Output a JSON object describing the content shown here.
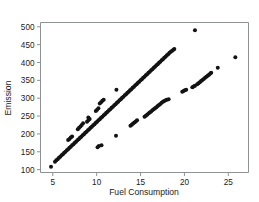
{
  "chart_data": {
    "type": "scatter",
    "title": "",
    "xlabel": "Fuel Consumption",
    "ylabel": "Emission",
    "xlim": [
      3.6,
      27.3
    ],
    "ylim": [
      92,
      512
    ],
    "xticks": [
      5,
      10,
      15,
      20,
      25
    ],
    "xtick_labels": [
      "5",
      "10",
      "15",
      "20",
      "25"
    ],
    "yticks": [
      100,
      150,
      200,
      250,
      300,
      350,
      400,
      450,
      500
    ],
    "ytick_labels": [
      "100",
      "150",
      "200",
      "250",
      "300",
      "350",
      "400",
      "450",
      "500"
    ],
    "grid": false,
    "legend": "none",
    "marker": "filled-circle",
    "marker_color": "#131313",
    "frame_color": "#8e9196",
    "background": "#ffffff",
    "series": [
      {
        "name": "main-band",
        "comment": "dense upper linear band, slope approx 23.5 emission per unit fuel",
        "points": [
          [
            5.25,
            122
          ],
          [
            5.4,
            126
          ],
          [
            5.55,
            129
          ],
          [
            5.7,
            133
          ],
          [
            5.85,
            136
          ],
          [
            6.0,
            140
          ],
          [
            6.15,
            143
          ],
          [
            6.3,
            147
          ],
          [
            6.45,
            150
          ],
          [
            6.6,
            154
          ],
          [
            6.75,
            157
          ],
          [
            6.9,
            161
          ],
          [
            7.05,
            164
          ],
          [
            7.2,
            168
          ],
          [
            7.35,
            171
          ],
          [
            7.5,
            175
          ],
          [
            7.65,
            178
          ],
          [
            7.8,
            182
          ],
          [
            7.95,
            185
          ],
          [
            8.1,
            189
          ],
          [
            8.25,
            192
          ],
          [
            8.4,
            196
          ],
          [
            8.55,
            199
          ],
          [
            8.7,
            203
          ],
          [
            8.85,
            206
          ],
          [
            9.0,
            210
          ],
          [
            9.15,
            213
          ],
          [
            9.3,
            217
          ],
          [
            9.45,
            220
          ],
          [
            9.6,
            224
          ],
          [
            9.75,
            227
          ],
          [
            9.9,
            231
          ],
          [
            10.05,
            234
          ],
          [
            10.2,
            238
          ],
          [
            10.35,
            241
          ],
          [
            10.5,
            245
          ],
          [
            10.65,
            248
          ],
          [
            10.8,
            252
          ],
          [
            10.95,
            255
          ],
          [
            11.1,
            259
          ],
          [
            11.25,
            262
          ],
          [
            11.4,
            266
          ],
          [
            11.55,
            269
          ],
          [
            11.7,
            273
          ],
          [
            11.85,
            276
          ],
          [
            12.0,
            280
          ],
          [
            12.15,
            283
          ],
          [
            12.3,
            287
          ],
          [
            12.45,
            290
          ],
          [
            12.6,
            294
          ],
          [
            12.75,
            297
          ],
          [
            12.9,
            301
          ],
          [
            13.05,
            304
          ],
          [
            13.2,
            308
          ],
          [
            13.35,
            311
          ],
          [
            13.5,
            315
          ],
          [
            13.65,
            318
          ],
          [
            13.8,
            322
          ],
          [
            13.95,
            325
          ],
          [
            14.1,
            329
          ],
          [
            14.25,
            332
          ],
          [
            14.4,
            336
          ],
          [
            14.55,
            339
          ],
          [
            14.7,
            343
          ],
          [
            14.85,
            346
          ],
          [
            15.0,
            350
          ],
          [
            15.15,
            353
          ],
          [
            15.3,
            357
          ],
          [
            15.45,
            360
          ],
          [
            15.6,
            364
          ],
          [
            15.75,
            367
          ],
          [
            15.9,
            371
          ],
          [
            16.05,
            374
          ],
          [
            16.2,
            378
          ],
          [
            16.35,
            381
          ],
          [
            16.5,
            385
          ],
          [
            16.65,
            388
          ],
          [
            16.8,
            392
          ],
          [
            16.95,
            395
          ],
          [
            17.1,
            399
          ],
          [
            17.25,
            402
          ],
          [
            17.4,
            406
          ],
          [
            17.55,
            409
          ],
          [
            17.7,
            413
          ],
          [
            17.85,
            416
          ],
          [
            18.0,
            420
          ],
          [
            18.15,
            423
          ],
          [
            18.3,
            427
          ],
          [
            18.45,
            430
          ],
          [
            18.6,
            433
          ],
          [
            18.75,
            436
          ],
          [
            18.85,
            438
          ]
        ]
      },
      {
        "name": "lower-band",
        "comment": "second sparser linear band offset to the right, lower slope",
        "points": [
          [
            13.85,
            223
          ],
          [
            14.0,
            226
          ],
          [
            14.15,
            229
          ],
          [
            14.3,
            232
          ],
          [
            14.45,
            235
          ],
          [
            14.6,
            238
          ],
          [
            15.45,
            248
          ],
          [
            15.6,
            251
          ],
          [
            15.75,
            254
          ],
          [
            15.9,
            257
          ],
          [
            16.05,
            260
          ],
          [
            16.2,
            263
          ],
          [
            16.35,
            266
          ],
          [
            16.5,
            269
          ],
          [
            16.65,
            272
          ],
          [
            16.8,
            275
          ],
          [
            16.95,
            278
          ],
          [
            17.1,
            281
          ],
          [
            17.25,
            284
          ],
          [
            17.4,
            287
          ],
          [
            17.55,
            290
          ],
          [
            17.7,
            292
          ],
          [
            17.85,
            294
          ],
          [
            18.0,
            296
          ],
          [
            18.2,
            297
          ],
          [
            19.75,
            318
          ],
          [
            19.9,
            320
          ],
          [
            20.05,
            322
          ],
          [
            20.2,
            324
          ],
          [
            20.9,
            331
          ],
          [
            21.05,
            333
          ],
          [
            21.2,
            335
          ],
          [
            21.45,
            339
          ],
          [
            21.6,
            342
          ],
          [
            21.75,
            345
          ],
          [
            21.9,
            348
          ],
          [
            22.05,
            351
          ],
          [
            22.2,
            354
          ],
          [
            22.35,
            357
          ],
          [
            22.5,
            360
          ],
          [
            22.65,
            363
          ],
          [
            22.8,
            366
          ],
          [
            22.95,
            369
          ],
          [
            23.05,
            371
          ]
        ]
      },
      {
        "name": "upper-satellite-clusters",
        "comment": "short segments of points sitting above the main band",
        "points": [
          [
            6.75,
            183
          ],
          [
            6.9,
            186
          ],
          [
            7.05,
            190
          ],
          [
            7.2,
            193
          ],
          [
            7.85,
            213
          ],
          [
            8.0,
            217
          ],
          [
            8.15,
            221
          ],
          [
            8.3,
            225
          ],
          [
            8.9,
            234
          ],
          [
            9.05,
            238
          ],
          [
            9.2,
            242
          ],
          [
            9.9,
            264
          ],
          [
            10.05,
            268
          ],
          [
            10.2,
            272
          ],
          [
            10.35,
            285
          ],
          [
            10.5,
            289
          ],
          [
            10.65,
            293
          ],
          [
            10.8,
            296
          ],
          [
            9.05,
            246
          ],
          [
            8.45,
            230
          ]
        ]
      },
      {
        "name": "isolated-outliers",
        "comment": "individual scattered points away from both bands",
        "points": [
          [
            4.8,
            108
          ],
          [
            10.1,
            163
          ],
          [
            10.25,
            166
          ],
          [
            10.55,
            168
          ],
          [
            12.2,
            195
          ],
          [
            12.25,
            324
          ],
          [
            21.2,
            490
          ],
          [
            23.8,
            385
          ],
          [
            25.8,
            415
          ]
        ]
      }
    ]
  },
  "axes": {
    "x_title": "Fuel Consumption",
    "y_title": "Emission"
  }
}
